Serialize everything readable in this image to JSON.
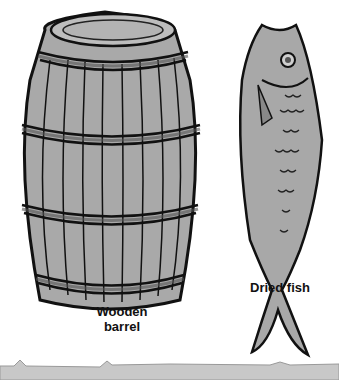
{
  "illustration": {
    "items": [
      {
        "id": "barrel",
        "label_lines": [
          "Wooden",
          "barrel"
        ]
      },
      {
        "id": "fish",
        "label": "Dried fish"
      }
    ],
    "colors": {
      "fill_gray": "#a8a8a8",
      "ink": "#111111",
      "ground": "#c8c8c8",
      "background": "#ffffff"
    }
  }
}
